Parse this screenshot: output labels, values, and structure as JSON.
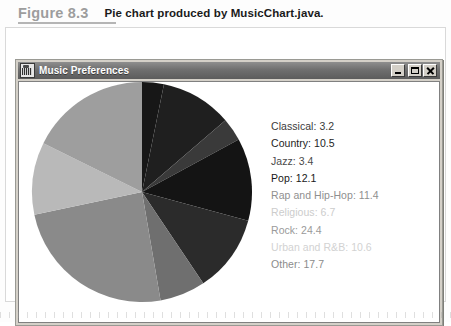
{
  "figure": {
    "number": "Figure 8.3",
    "title": "Pie chart produced by MusicChart.java."
  },
  "window": {
    "title": "Music Preferences",
    "icon": "music-app-icon",
    "controls": {
      "minimize": "_",
      "maximize": "□",
      "close": "×"
    }
  },
  "chart_data": {
    "type": "pie",
    "title": "Music Preferences",
    "start_angle_deg": -90,
    "direction": "clockwise",
    "total": 100.1,
    "units": "percent",
    "center": {
      "x": 111,
      "y": 110
    },
    "radius": 110,
    "categories": [
      "Classical",
      "Country",
      "Jazz",
      "Pop",
      "Rap and Hip-Hop",
      "Religious",
      "Rock",
      "Urban and R&B",
      "Other"
    ],
    "values": [
      3.2,
      10.5,
      3.4,
      12.1,
      11.4,
      6.7,
      24.4,
      10.6,
      17.7
    ],
    "colors": [
      "#171717",
      "#1f1f1f",
      "#3a3a3a",
      "#141414",
      "#2b2b2b",
      "#6f6f6f",
      "#8a8a8a",
      "#b9b9b9",
      "#9e9e9e"
    ],
    "legend_position": "right",
    "legend": [
      {
        "label": "Classical",
        "value": 3.2,
        "text": "Classical: 3.2",
        "color": "#3b3b3b"
      },
      {
        "label": "Country",
        "value": 10.5,
        "text": "Country: 10.5",
        "color": "#1d1d1d"
      },
      {
        "label": "Jazz",
        "value": 3.4,
        "text": "Jazz: 3.4",
        "color": "#4a4a4a"
      },
      {
        "label": "Pop",
        "value": 12.1,
        "text": "Pop: 12.1",
        "color": "#181818"
      },
      {
        "label": "Rap and Hip-Hop",
        "value": 11.4,
        "text": "Rap and Hip-Hop: 11.4",
        "color": "#8f8f8f"
      },
      {
        "label": "Religious",
        "value": 6.7,
        "text": "Religious: 6.7",
        "color": "#cccccc"
      },
      {
        "label": "Rock",
        "value": 24.4,
        "text": "Rock: 24.4",
        "color": "#9a9a9a"
      },
      {
        "label": "Urban and R&B",
        "value": 10.6,
        "text": "Urban and R&B: 10.6",
        "color": "#d2d2d2"
      },
      {
        "label": "Other",
        "value": 17.7,
        "text": "Other: 17.7",
        "color": "#8b8b8b"
      }
    ]
  }
}
